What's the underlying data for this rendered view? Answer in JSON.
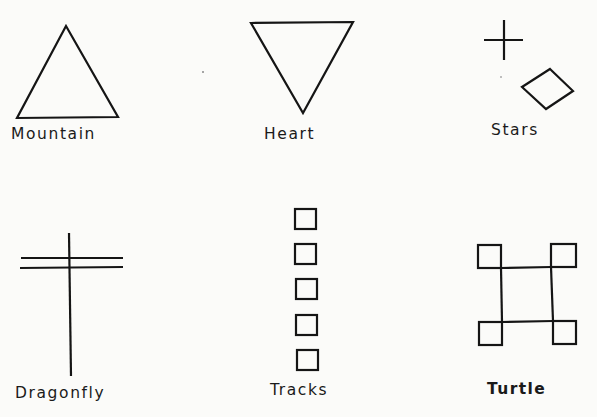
{
  "title": "",
  "symbols": [
    {
      "name": "Mountain",
      "shape": "upward-triangle",
      "row": 1,
      "col": 1
    },
    {
      "name": "Heart",
      "shape": "downward-triangle",
      "row": 1,
      "col": 2
    },
    {
      "name": "Stars",
      "shape": "cross-and-diamond",
      "row": 1,
      "col": 3
    },
    {
      "name": "Dragonfly",
      "shape": "vertical-line-with-double-crossbar",
      "row": 2,
      "col": 1
    },
    {
      "name": "Tracks",
      "shape": "column-of-five-squares",
      "row": 2,
      "col": 2
    },
    {
      "name": "Turtle",
      "shape": "square-with-corner-squares",
      "row": 2,
      "col": 3
    }
  ],
  "labels": {
    "mountain": "Mountain",
    "heart": "Heart",
    "stars": "Stars",
    "dragonfly": "Dragonfly",
    "tracks": "Tracks",
    "turtle": "Turtle"
  },
  "colors": {
    "background": "#fbfbf9",
    "ink": "#151515"
  }
}
